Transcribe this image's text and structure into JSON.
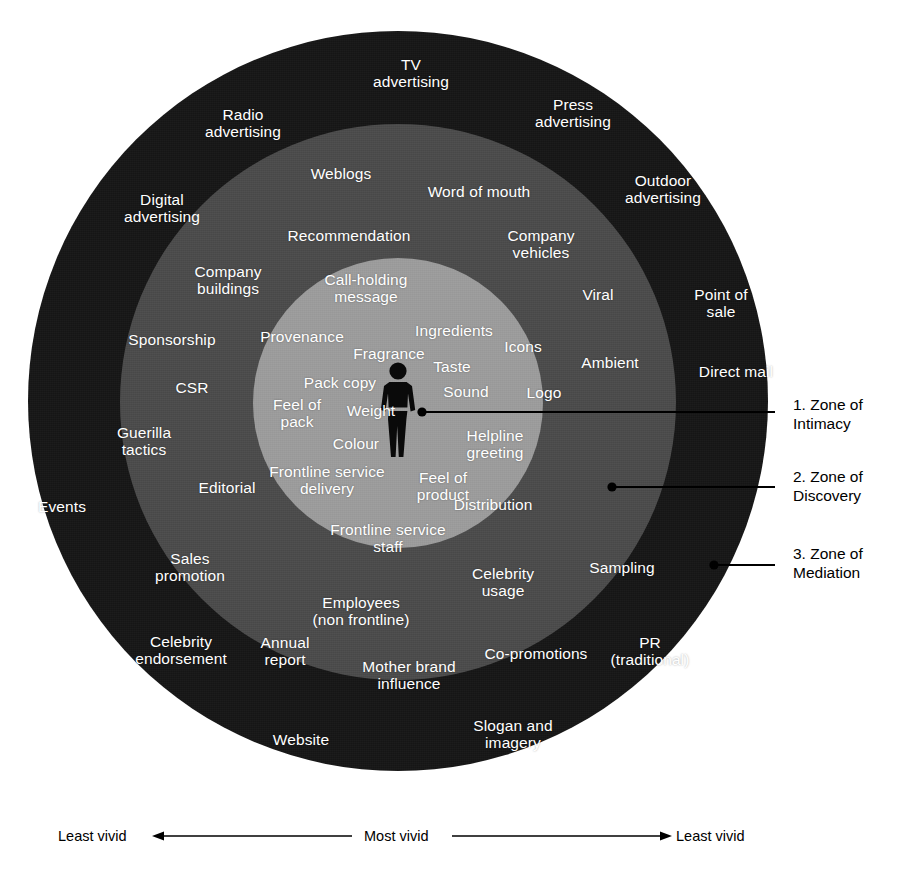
{
  "diagram": {
    "colors": {
      "zone_outer": "#161616",
      "zone_middle": "#4b4b4b",
      "zone_inner": "#9d9d9d",
      "label_text": "#ffffff",
      "annotation_text": "#000000",
      "background": "#ffffff"
    },
    "center_figure": "human-figure-icon"
  },
  "zones": [
    {
      "number": "1.",
      "name": "Zone of Intimacy",
      "callout": "1. Zone of\nIntimacy",
      "items": [
        "Call-holding\nmessage",
        "Provenance",
        "Ingredients",
        "Fragrance",
        "Taste",
        "Icons",
        "Pack copy",
        "Sound",
        "Logo",
        "Feel of\npack",
        "Weight",
        "Colour",
        "Helpline\ngreeting",
        "Frontline service\ndelivery",
        "Feel of\nproduct",
        "Distribution",
        "Frontline service\nstaff"
      ]
    },
    {
      "number": "2.",
      "name": "Zone of Discovery",
      "callout": "2. Zone of\nDiscovery",
      "items": [
        "Weblogs",
        "Word of mouth",
        "Recommendation",
        "Company\nvehicles",
        "Company\nbuildings",
        "Viral",
        "Sponsorship",
        "Ambient",
        "CSR",
        "Guerilla\ntactics",
        "Editorial",
        "Sales\npromotion",
        "Employees\n(non frontline)",
        "Celebrity\nusage",
        "Annual\nreport",
        "Co-promotions",
        "Mother brand\ninfluence",
        "Sampling"
      ]
    },
    {
      "number": "3.",
      "name": "Zone of Mediation",
      "callout": "3. Zone of\nMediation",
      "items": [
        "TV\nadvertising",
        "Radio\nadvertising",
        "Press\nadvertising",
        "Digital\nadvertising",
        "Outdoor\nadvertising",
        "Point of\nsale",
        "Direct mail",
        "Events",
        "Celebrity\nendorsement",
        "Website",
        "Slogan and\nimagery",
        "PR\n(traditional)"
      ]
    }
  ],
  "nodes": {
    "inner": [
      {
        "label": "Call-holding\nmessage",
        "x": 366,
        "y": 289
      },
      {
        "label": "Provenance",
        "x": 302,
        "y": 337
      },
      {
        "label": "Ingredients",
        "x": 454,
        "y": 331
      },
      {
        "label": "Fragrance",
        "x": 389,
        "y": 354
      },
      {
        "label": "Taste",
        "x": 452,
        "y": 367
      },
      {
        "label": "Icons",
        "x": 523,
        "y": 347
      },
      {
        "label": "Pack copy",
        "x": 340,
        "y": 383
      },
      {
        "label": "Sound",
        "x": 466,
        "y": 392
      },
      {
        "label": "Logo",
        "x": 544,
        "y": 393
      },
      {
        "label": "Feel of\npack",
        "x": 297,
        "y": 414
      },
      {
        "label": "Weight",
        "x": 371,
        "y": 411
      },
      {
        "label": "Colour",
        "x": 356,
        "y": 444
      },
      {
        "label": "Helpline\ngreeting",
        "x": 495,
        "y": 445
      },
      {
        "label": "Frontline service\ndelivery",
        "x": 327,
        "y": 481
      },
      {
        "label": "Feel of\nproduct",
        "x": 443,
        "y": 487
      },
      {
        "label": "Distribution",
        "x": 493,
        "y": 505
      },
      {
        "label": "Frontline service\nstaff",
        "x": 388,
        "y": 539
      }
    ],
    "middle": [
      {
        "label": "Weblogs",
        "x": 341,
        "y": 174
      },
      {
        "label": "Word of mouth",
        "x": 479,
        "y": 192
      },
      {
        "label": "Recommendation",
        "x": 349,
        "y": 236
      },
      {
        "label": "Company\nvehicles",
        "x": 541,
        "y": 245
      },
      {
        "label": "Company\nbuildings",
        "x": 228,
        "y": 281
      },
      {
        "label": "Viral",
        "x": 598,
        "y": 295
      },
      {
        "label": "Sponsorship",
        "x": 172,
        "y": 340
      },
      {
        "label": "Ambient",
        "x": 610,
        "y": 363
      },
      {
        "label": "CSR",
        "x": 192,
        "y": 388
      },
      {
        "label": "Guerilla\ntactics",
        "x": 144,
        "y": 442
      },
      {
        "label": "Editorial",
        "x": 227,
        "y": 488
      },
      {
        "label": "Sales\npromotion",
        "x": 190,
        "y": 568
      },
      {
        "label": "Employees\n(non frontline)",
        "x": 361,
        "y": 612
      },
      {
        "label": "Celebrity\nusage",
        "x": 503,
        "y": 583
      },
      {
        "label": "Annual\nreport",
        "x": 285,
        "y": 652
      },
      {
        "label": "Co-promotions",
        "x": 536,
        "y": 654
      },
      {
        "label": "Mother brand\ninfluence",
        "x": 409,
        "y": 676
      },
      {
        "label": "Sampling",
        "x": 622,
        "y": 568
      }
    ],
    "outer": [
      {
        "label": "TV\navertising_placeholder",
        "x": -1000,
        "y": -1000
      },
      {
        "label": "TV\nadvertising",
        "x": 411,
        "y": 74
      },
      {
        "label": "Radio\nadvertising",
        "x": 243,
        "y": 124
      },
      {
        "label": "Press\nadvertising",
        "x": 573,
        "y": 114
      },
      {
        "label": "Digital\nadvertising",
        "x": 162,
        "y": 209
      },
      {
        "label": "Outdoor\nadvertising",
        "x": 663,
        "y": 190
      },
      {
        "label": "Point of\nsale",
        "x": 721,
        "y": 304
      },
      {
        "label": "Direct mail",
        "x": 736,
        "y": 372
      },
      {
        "label": "Events",
        "x": 62,
        "y": 507
      },
      {
        "label": "Celebrity\nendorsement",
        "x": 181,
        "y": 651
      },
      {
        "label": "Website",
        "x": 301,
        "y": 740
      },
      {
        "label": "Slogan and\nimagery",
        "x": 513,
        "y": 735
      },
      {
        "label": "PR\n(traditional)",
        "x": 650,
        "y": 652
      }
    ]
  },
  "callouts": [
    {
      "name": "zone-1-callout",
      "text": "1. Zone of\nIntimacy",
      "label_x": 793,
      "label_y": 396,
      "dot_x": 422,
      "dot_y": 412,
      "line_x2": 775,
      "line_y2": 412
    },
    {
      "name": "zone-2-callout",
      "text": "2. Zone of\nDiscovery",
      "label_x": 793,
      "label_y": 468,
      "dot_x": 612,
      "dot_y": 487,
      "line_x2": 775,
      "line_y2": 487
    },
    {
      "name": "zone-3-callout",
      "text": "3. Zone of\nMediation",
      "label_x": 793,
      "label_y": 545,
      "dot_x": 714,
      "dot_y": 565,
      "line_x2": 775,
      "line_y2": 565
    }
  ],
  "axis": {
    "left_label": "Least vivid",
    "center_label": "Most vivid",
    "right_label": "Least vivid"
  }
}
